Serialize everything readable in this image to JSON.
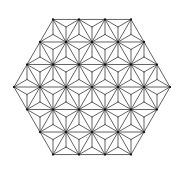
{
  "diagram": {
    "type": "asanoha-hexagon-pattern",
    "hexagon": {
      "center_x": 92,
      "center_y": 87,
      "side_triangles": 3,
      "triangle_side_px": 26
    },
    "style": {
      "background": "#ffffff",
      "stroke": "#3a3a3a",
      "stroke_width": 0.8,
      "vertex_dot_color": "#111111",
      "vertex_dot_radius": 1.1
    }
  }
}
